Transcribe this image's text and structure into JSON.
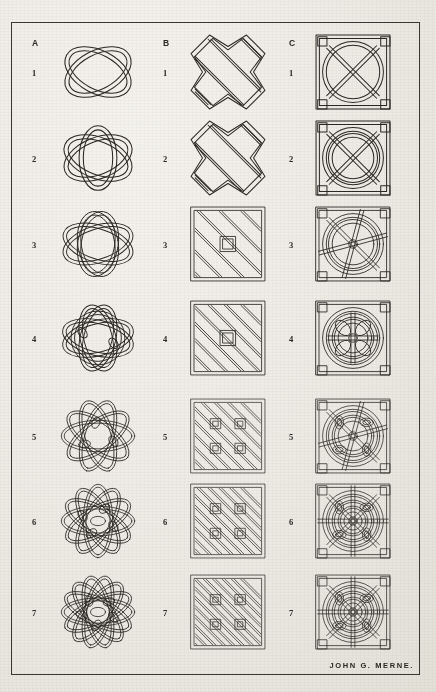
{
  "plate": {
    "title": "Celtic Knotwork Designs Plate",
    "signature": "JOHN G. MERNE.",
    "border_color": "#3a3631",
    "ink_color": "#2a2724",
    "paper_color": "#efece5"
  },
  "columns": [
    {
      "key": "A",
      "label": "A",
      "x": 46,
      "description": "Free-flowing curvilinear interlace knots"
    },
    {
      "key": "B",
      "label": "B",
      "x": 176,
      "description": "Angular rectilinear plaitwork knots"
    },
    {
      "key": "C",
      "label": "C",
      "x": 301,
      "description": "Square-framed circular interlace knots"
    }
  ],
  "rows": [
    {
      "index": 1,
      "label": "1",
      "y": 36,
      "center_y": 72
    },
    {
      "index": 2,
      "label": "2",
      "y": 150,
      "center_y": 158
    },
    {
      "index": 3,
      "label": "3",
      "y": 236,
      "center_y": 244
    },
    {
      "index": 4,
      "label": "4",
      "y": 330,
      "center_y": 338
    },
    {
      "index": 5,
      "label": "5",
      "y": 428,
      "center_y": 436
    },
    {
      "index": 6,
      "label": "6",
      "y": 513,
      "center_y": 521
    },
    {
      "index": 7,
      "label": "7",
      "y": 606,
      "center_y": 612
    }
  ],
  "cells": [
    {
      "id": "A1",
      "column": "A",
      "row": 1,
      "name": "knot-a1",
      "style": "curvilinear",
      "complexity": 1
    },
    {
      "id": "A2",
      "column": "A",
      "row": 2,
      "name": "knot-a2",
      "style": "curvilinear",
      "complexity": 2
    },
    {
      "id": "A3",
      "column": "A",
      "row": 3,
      "name": "knot-a3",
      "style": "curvilinear",
      "complexity": 3
    },
    {
      "id": "A4",
      "column": "A",
      "row": 4,
      "name": "knot-a4",
      "style": "curvilinear",
      "complexity": 4
    },
    {
      "id": "A5",
      "column": "A",
      "row": 5,
      "name": "knot-a5",
      "style": "curvilinear",
      "complexity": 5
    },
    {
      "id": "A6",
      "column": "A",
      "row": 6,
      "name": "knot-a6",
      "style": "curvilinear",
      "complexity": 6
    },
    {
      "id": "A7",
      "column": "A",
      "row": 7,
      "name": "knot-a7",
      "style": "curvilinear",
      "complexity": 7
    },
    {
      "id": "B1",
      "column": "B",
      "row": 1,
      "name": "knot-b1",
      "style": "angular",
      "complexity": 1
    },
    {
      "id": "B2",
      "column": "B",
      "row": 2,
      "name": "knot-b2",
      "style": "angular",
      "complexity": 2
    },
    {
      "id": "B3",
      "column": "B",
      "row": 3,
      "name": "knot-b3",
      "style": "angular",
      "complexity": 3
    },
    {
      "id": "B4",
      "column": "B",
      "row": 4,
      "name": "knot-b4",
      "style": "angular",
      "complexity": 4
    },
    {
      "id": "B5",
      "column": "B",
      "row": 5,
      "name": "knot-b5",
      "style": "angular",
      "complexity": 5
    },
    {
      "id": "B6",
      "column": "B",
      "row": 6,
      "name": "knot-b6",
      "style": "angular",
      "complexity": 6
    },
    {
      "id": "B7",
      "column": "B",
      "row": 7,
      "name": "knot-b7",
      "style": "angular",
      "complexity": 7
    },
    {
      "id": "C1",
      "column": "C",
      "row": 1,
      "name": "knot-c1",
      "style": "framed-circular",
      "complexity": 1
    },
    {
      "id": "C2",
      "column": "C",
      "row": 2,
      "name": "knot-c2",
      "style": "framed-circular",
      "complexity": 2
    },
    {
      "id": "C3",
      "column": "C",
      "row": 3,
      "name": "knot-c3",
      "style": "framed-circular",
      "complexity": 3
    },
    {
      "id": "C4",
      "column": "C",
      "row": 4,
      "name": "knot-c4",
      "style": "framed-circular",
      "complexity": 4
    },
    {
      "id": "C5",
      "column": "C",
      "row": 5,
      "name": "knot-c5",
      "style": "framed-circular",
      "complexity": 5
    },
    {
      "id": "C6",
      "column": "C",
      "row": 6,
      "name": "knot-c6",
      "style": "framed-circular",
      "complexity": 6
    },
    {
      "id": "C7",
      "column": "C",
      "row": 7,
      "name": "knot-c7",
      "style": "framed-circular",
      "complexity": 7
    }
  ]
}
